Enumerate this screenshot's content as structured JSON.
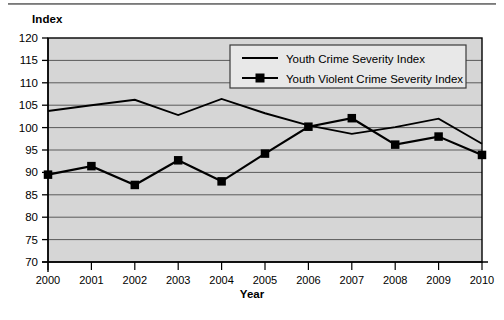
{
  "chart_data": {
    "type": "line",
    "title": "",
    "xlabel": "Year",
    "ylabel": "Index",
    "ylim": [
      70,
      120
    ],
    "yticks": [
      70,
      75,
      80,
      85,
      90,
      95,
      100,
      105,
      110,
      115,
      120
    ],
    "grid": true,
    "legend_position": "top-right-inside",
    "categories": [
      "2000",
      "2001",
      "2002",
      "2003",
      "2004",
      "2005",
      "2006",
      "2007",
      "2008",
      "2009",
      "2010"
    ],
    "x": [
      2000,
      2001,
      2002,
      2003,
      2004,
      2005,
      2006,
      2007,
      2008,
      2009,
      2010
    ],
    "series": [
      {
        "name": "Youth Crime Severity Index",
        "marker": "none",
        "color": "#000000",
        "values": [
          103.7,
          105.0,
          106.2,
          102.8,
          106.4,
          103.2,
          100.5,
          98.6,
          100.1,
          102.0,
          96.4
        ]
      },
      {
        "name": "Youth Violent Crime Severity Index",
        "marker": "square",
        "color": "#000000",
        "values": [
          89.5,
          91.4,
          87.2,
          92.7,
          88.0,
          94.2,
          100.2,
          102.1,
          96.2,
          98.0,
          93.9
        ]
      }
    ]
  },
  "axes": {
    "y_title": "Index",
    "x_title": "Year"
  },
  "legend": {
    "items": [
      {
        "label": "Youth Crime Severity Index",
        "marker": "line"
      },
      {
        "label": "Youth Violent Crime Severity Index",
        "marker": "line-square"
      }
    ]
  },
  "style": {
    "plot_background": "#d6d6d6",
    "gridline_color": "#5a5a5a",
    "axis_color": "#000000",
    "series_color": "#000000",
    "legend_background": "#e8e8e8"
  }
}
